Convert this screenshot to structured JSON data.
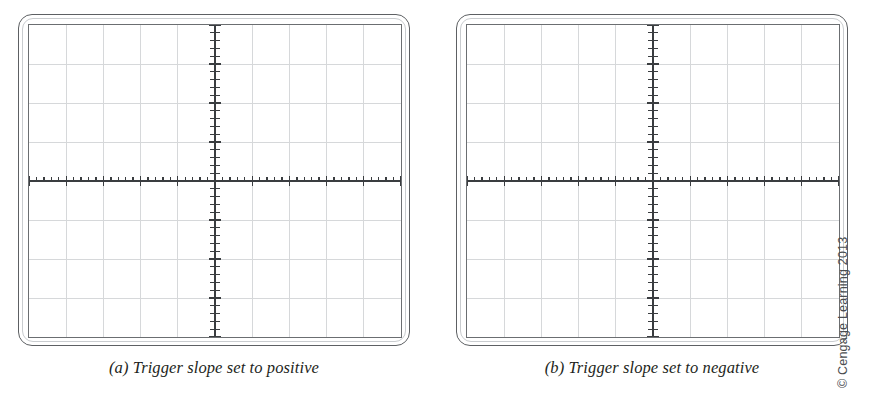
{
  "figure": {
    "background_color": "#ffffff",
    "credit": "© Cengage Learning 2013",
    "panels": [
      {
        "id": "a",
        "caption": "(a) Trigger slope set to positive",
        "trigger_slope": "positive"
      },
      {
        "id": "b",
        "caption": "(b) Trigger slope set to negative",
        "trigger_slope": "negative"
      }
    ]
  },
  "chart_data": {
    "type": "line",
    "xlabel": "",
    "ylabel": "",
    "grid": true,
    "legend": "none",
    "graticule": {
      "horizontal_divisions": 10,
      "vertical_divisions": 8,
      "minor_ticks_per_division": 5,
      "grid_color": "#d6d8da",
      "axis_color": "#3a3d40",
      "screen_border_color": "#6b6e71",
      "bezel_color": "#5d6063",
      "x_axis_position_division": 4,
      "y_axis_position_division": 5,
      "xlim": [
        -5,
        5
      ],
      "ylim": [
        -4,
        4
      ]
    },
    "series": [
      {
        "name": "(a) Trigger slope set to positive",
        "panel": "a",
        "trace_visible": false,
        "values": []
      },
      {
        "name": "(b) Trigger slope set to negative",
        "panel": "b",
        "trace_visible": false,
        "values": []
      }
    ]
  }
}
